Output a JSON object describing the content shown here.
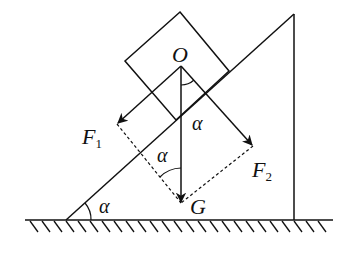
{
  "diagram": {
    "type": "force-decomposition-on-incline",
    "colors": {
      "stroke": "#111111",
      "background": "#ffffff"
    },
    "labels": {
      "origin": "O",
      "gravity": "G",
      "force1": "F",
      "force1_sub": "1",
      "force2": "F",
      "force2_sub": "2",
      "angle_incline": "α",
      "angle_between_G_F1": "α",
      "angle_between_G_F2": "α"
    },
    "elements": {
      "block": "square block resting on incline",
      "incline": "right triangle wedge with angle α at base",
      "ground": "hatched ground line",
      "vector_G": "vertical downward arrow from O to G",
      "vector_F1": "arrow parallel to incline, pointing down-left",
      "vector_F2": "arrow perpendicular to incline, pointing down-right",
      "dashed_parallelogram": "dashed lines from F1 and F2 tips to G"
    }
  }
}
